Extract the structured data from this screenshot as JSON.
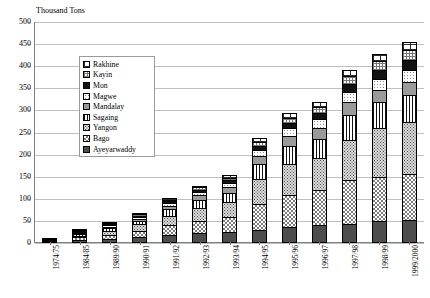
{
  "chart_data": {
    "type": "bar",
    "subtype": "stacked-column",
    "title": "",
    "ylabel": "Thousand Tons",
    "xlabel": "",
    "ylim": [
      0,
      500
    ],
    "ytick_step": 50,
    "yticks": [
      0,
      50,
      100,
      150,
      200,
      250,
      300,
      350,
      400,
      450,
      500
    ],
    "grid": true,
    "legend_position": "upper-left-inside",
    "categories": [
      "1974/75",
      "1984/85",
      "1989/90",
      "1990/91",
      "1991/92",
      "1992/93",
      "1993/94",
      "1994/95",
      "1995/96",
      "1996/97",
      "1997/98",
      "1998/99",
      "1999/2000"
    ],
    "series_order_bottom_to_top": [
      "Ayeyarwaddy",
      "Bago",
      "Yangon",
      "Sagaing",
      "Mandalay",
      "Magwe",
      "Mon",
      "Kayin",
      "Rakhine"
    ],
    "series": [
      {
        "name": "Ayeyarwaddy",
        "pattern": "solid-dark",
        "values": [
          2,
          7,
          10,
          14,
          18,
          22,
          24,
          30,
          36,
          40,
          44,
          50,
          52
        ]
      },
      {
        "name": "Bago",
        "pattern": "checker",
        "values": [
          1,
          6,
          9,
          14,
          22,
          28,
          34,
          58,
          72,
          80,
          98,
          100,
          104
        ]
      },
      {
        "name": "Yangon",
        "pattern": "dots-dense",
        "values": [
          1,
          4,
          8,
          14,
          22,
          30,
          34,
          56,
          70,
          72,
          92,
          110,
          118
        ]
      },
      {
        "name": "Sagaing",
        "pattern": "vstripe",
        "values": [
          1,
          3,
          6,
          8,
          14,
          18,
          22,
          34,
          42,
          44,
          56,
          58,
          60
        ]
      },
      {
        "name": "Mandalay",
        "pattern": "solid-mid",
        "values": [
          0,
          2,
          4,
          5,
          8,
          10,
          12,
          18,
          22,
          24,
          28,
          28,
          30
        ]
      },
      {
        "name": "Magwe",
        "pattern": "dots-light",
        "values": [
          0,
          2,
          3,
          4,
          6,
          8,
          10,
          14,
          18,
          20,
          24,
          26,
          28
        ]
      },
      {
        "name": "Mon",
        "pattern": "solid-black",
        "values": [
          0,
          1,
          2,
          3,
          4,
          5,
          6,
          10,
          12,
          14,
          18,
          20,
          22
        ]
      },
      {
        "name": "Kayin",
        "pattern": "grid-fine",
        "values": [
          0,
          1,
          2,
          3,
          4,
          5,
          6,
          9,
          12,
          14,
          18,
          20,
          22
        ]
      },
      {
        "name": "Rakhine",
        "pattern": "brick",
        "values": [
          0,
          1,
          1,
          2,
          3,
          4,
          5,
          8,
          10,
          12,
          14,
          16,
          18
        ]
      }
    ],
    "totals": [
      5,
      27,
      45,
      67,
      101,
      130,
      153,
      237,
      294,
      320,
      392,
      428,
      454
    ]
  },
  "legend": {
    "items": [
      {
        "label": "Rakhine",
        "pattern": "brick"
      },
      {
        "label": "Kayin",
        "pattern": "grid-fine"
      },
      {
        "label": "Mon",
        "pattern": "solid-black"
      },
      {
        "label": "Magwe",
        "pattern": "dots-light"
      },
      {
        "label": "Mandalay",
        "pattern": "solid-mid"
      },
      {
        "label": "Sagaing",
        "pattern": "vstripe"
      },
      {
        "label": "Yangon",
        "pattern": "dots-dense"
      },
      {
        "label": "Bago",
        "pattern": "checker"
      },
      {
        "label": "Ayeyarwaddy",
        "pattern": "solid-dark"
      }
    ]
  },
  "colors": {
    "gridline": "#bfbfbf",
    "axis": "#808080",
    "text": "#000000",
    "background": "#ffffff"
  }
}
